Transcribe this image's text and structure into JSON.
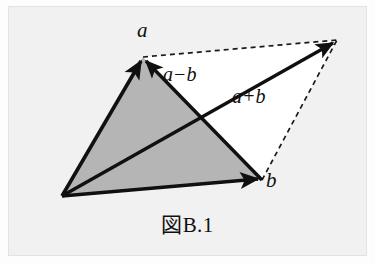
{
  "figure": {
    "caption": "図B.1",
    "background_color": "#f1f1f1",
    "ink_color": "#101010",
    "shaded_fill_color": "#b5b5b5",
    "open_fill_color": "#ffffff",
    "labels": {
      "vector_a": "a",
      "vector_b": "b",
      "difference": "a−b",
      "sum": "a+b"
    },
    "points": {
      "origin": [
        62,
        196
      ],
      "a_tip": [
        143,
        57
      ],
      "b_tip": [
        262,
        180
      ],
      "sum_tip": [
        337,
        40
      ],
      "diagonal_crossing": [
        200,
        118
      ]
    },
    "solid_vectors": [
      {
        "name": "a",
        "from": [
          62,
          196
        ],
        "to": [
          143,
          57
        ]
      },
      {
        "name": "b",
        "from": [
          62,
          196
        ],
        "to": [
          262,
          180
        ]
      },
      {
        "name": "a+b",
        "from": [
          62,
          196
        ],
        "to": [
          337,
          40
        ]
      },
      {
        "name": "a−b",
        "from": [
          262,
          180
        ],
        "to": [
          143,
          57
        ]
      }
    ],
    "dashed_edges": [
      {
        "name": "a-to-sum",
        "from": [
          143,
          57
        ],
        "to": [
          337,
          40
        ]
      },
      {
        "name": "b-to-sum",
        "from": [
          262,
          180
        ],
        "to": [
          337,
          40
        ]
      }
    ],
    "shaded_triangle": [
      [
        62,
        196
      ],
      [
        143,
        57
      ],
      [
        262,
        180
      ]
    ]
  }
}
